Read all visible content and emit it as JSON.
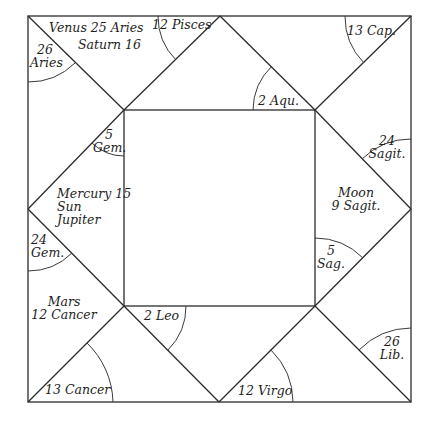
{
  "chart_title": "",
  "colors": {
    "line": "#2b2b2b",
    "text": "#1e1e1e",
    "background": "#ffffff"
  },
  "houses": {
    "top_left_corner": {
      "line1": "26",
      "line2": "Aries"
    },
    "top_left_upper": {
      "line1": "Venus 25 Aries",
      "line2": "Saturn 16"
    },
    "top_center_left": {
      "line1": "12 Pisces"
    },
    "top_right_corner": {
      "line1": "13 Cap."
    },
    "top_center_inner": {
      "line1": "2 Aqu."
    },
    "left_inner_top": {
      "line1": "5",
      "line2": "Gem."
    },
    "left_middle": {
      "line1": "Mercury 15",
      "line2": "Sun",
      "line3": "Jupiter"
    },
    "left_lower_corner": {
      "line1": "24",
      "line2": "Gem."
    },
    "left_bottom": {
      "line1": "Mars",
      "line2": "12 Cancer"
    },
    "bottom_left_corner": {
      "line1": "13 Cancer"
    },
    "bottom_center_inner": {
      "line1": "2 Leo"
    },
    "bottom_center_right": {
      "line1": "12 Virgo"
    },
    "right_upper_corner": {
      "line1": "24",
      "line2": "Sagit."
    },
    "right_middle": {
      "line1": "Moon",
      "line2": "9 Sagit."
    },
    "right_inner_bottom": {
      "line1": "5",
      "line2": "Sag."
    },
    "bottom_right_corner": {
      "line1": "26",
      "line2": "Lib."
    }
  }
}
